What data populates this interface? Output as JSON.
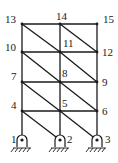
{
  "diagram": {
    "type": "truss-frame",
    "colors": {
      "line": "#1a1a1a",
      "background": "#ffffff"
    },
    "nodes": [
      {
        "id": "1",
        "label": "1",
        "x": 22,
        "y": 140,
        "support": "pin"
      },
      {
        "id": "2",
        "label": "2",
        "x": 60,
        "y": 140,
        "support": "pin"
      },
      {
        "id": "3",
        "label": "3",
        "x": 97,
        "y": 140,
        "support": "pin"
      },
      {
        "id": "4",
        "label": "4",
        "x": 22,
        "y": 111
      },
      {
        "id": "5",
        "label": "5",
        "x": 60,
        "y": 111
      },
      {
        "id": "6",
        "label": "6",
        "x": 97,
        "y": 111
      },
      {
        "id": "7",
        "label": "7",
        "x": 22,
        "y": 82
      },
      {
        "id": "8",
        "label": "8",
        "x": 60,
        "y": 82
      },
      {
        "id": "9",
        "label": "9",
        "x": 97,
        "y": 82
      },
      {
        "id": "10",
        "label": "10",
        "x": 22,
        "y": 52
      },
      {
        "id": "11",
        "label": "11",
        "x": 60,
        "y": 52
      },
      {
        "id": "12",
        "label": "12",
        "x": 97,
        "y": 52
      },
      {
        "id": "13",
        "label": "13",
        "x": 22,
        "y": 24
      },
      {
        "id": "14",
        "label": "14",
        "x": 60,
        "y": 24
      },
      {
        "id": "15",
        "label": "15",
        "x": 97,
        "y": 24
      }
    ],
    "members": [
      [
        "1",
        "4"
      ],
      [
        "4",
        "7"
      ],
      [
        "7",
        "10"
      ],
      [
        "10",
        "13"
      ],
      [
        "2",
        "5"
      ],
      [
        "5",
        "8"
      ],
      [
        "8",
        "11"
      ],
      [
        "11",
        "14"
      ],
      [
        "3",
        "6"
      ],
      [
        "6",
        "9"
      ],
      [
        "9",
        "12"
      ],
      [
        "12",
        "15"
      ],
      [
        "13",
        "14"
      ],
      [
        "14",
        "15"
      ],
      [
        "10",
        "11"
      ],
      [
        "11",
        "12"
      ],
      [
        "7",
        "8"
      ],
      [
        "8",
        "9"
      ],
      [
        "4",
        "5"
      ],
      [
        "5",
        "6"
      ],
      [
        "13",
        "11"
      ],
      [
        "14",
        "12"
      ],
      [
        "10",
        "8"
      ],
      [
        "11",
        "9"
      ],
      [
        "7",
        "5"
      ],
      [
        "8",
        "6"
      ],
      [
        "4",
        "2"
      ],
      [
        "5",
        "3"
      ]
    ]
  }
}
